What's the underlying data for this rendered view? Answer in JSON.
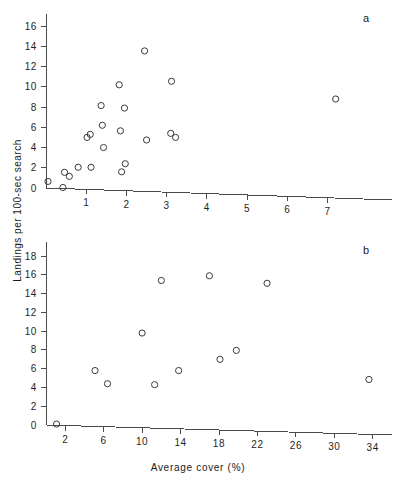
{
  "figure": {
    "y_axis_title": "Landings per 100-sec search",
    "x_axis_title": "Average cover (%)",
    "panel_a_letter": "a",
    "panel_b_letter": "b",
    "marker_color": "#3a3a3a",
    "axis_color": "#4a4a4a",
    "background_color": "#ffffff"
  },
  "chart_data": [
    {
      "type": "scatter",
      "title": "a",
      "xlabel": "Average cover (%)",
      "ylabel": "Landings per 100-sec search",
      "xlim": [
        0,
        8.6
      ],
      "ylim": [
        0,
        17.2
      ],
      "xticks": [
        1,
        2,
        3,
        4,
        5,
        6,
        7
      ],
      "xticklabels": [
        "1",
        "2",
        "3",
        "4",
        "5",
        "6",
        "7"
      ],
      "yticks": [
        2,
        4,
        6,
        8,
        10,
        12,
        14,
        16
      ],
      "yticklabels": [
        "2",
        "4",
        "6",
        "8",
        "10",
        "12",
        "14",
        "16"
      ],
      "origin_label": "0",
      "grid": false,
      "legend": false,
      "marker": "open-circle",
      "points": [
        {
          "x": 0.05,
          "y": 0.65
        },
        {
          "x": 0.42,
          "y": 0.05
        },
        {
          "x": 0.46,
          "y": 1.55
        },
        {
          "x": 0.58,
          "y": 1.15
        },
        {
          "x": 0.8,
          "y": 2.05
        },
        {
          "x": 1.02,
          "y": 5.0
        },
        {
          "x": 1.1,
          "y": 5.3
        },
        {
          "x": 1.12,
          "y": 2.05
        },
        {
          "x": 1.37,
          "y": 8.15
        },
        {
          "x": 1.4,
          "y": 6.2
        },
        {
          "x": 1.43,
          "y": 4.0
        },
        {
          "x": 1.82,
          "y": 10.2
        },
        {
          "x": 1.85,
          "y": 5.65
        },
        {
          "x": 1.88,
          "y": 1.6
        },
        {
          "x": 1.95,
          "y": 7.9
        },
        {
          "x": 1.97,
          "y": 2.4
        },
        {
          "x": 2.45,
          "y": 13.55
        },
        {
          "x": 2.5,
          "y": 4.75
        },
        {
          "x": 3.1,
          "y": 5.4
        },
        {
          "x": 3.12,
          "y": 10.55
        },
        {
          "x": 3.22,
          "y": 5.0
        },
        {
          "x": 7.2,
          "y": 8.8
        }
      ]
    },
    {
      "type": "scatter",
      "title": "b",
      "xlabel": "Average cover (%)",
      "ylabel": "Landings per 100-sec search",
      "xlim": [
        0,
        36
      ],
      "ylim": [
        0,
        19.5
      ],
      "xticks": [
        2,
        6,
        10,
        14,
        18,
        22,
        26,
        30,
        34
      ],
      "xticklabels": [
        "2",
        "6",
        "10",
        "14",
        "18",
        "22",
        "26",
        "30",
        "34"
      ],
      "yticks": [
        2,
        4,
        6,
        8,
        10,
        12,
        14,
        16,
        18
      ],
      "yticklabels": [
        "2",
        "4",
        "6",
        "8",
        "10",
        "12",
        "14",
        "16",
        "18"
      ],
      "origin_label": "0",
      "grid": false,
      "legend": false,
      "marker": "open-circle",
      "points": [
        {
          "x": 1.1,
          "y": 0.1
        },
        {
          "x": 5.1,
          "y": 5.8
        },
        {
          "x": 6.4,
          "y": 4.4
        },
        {
          "x": 10.0,
          "y": 9.8
        },
        {
          "x": 11.3,
          "y": 4.3
        },
        {
          "x": 12.0,
          "y": 15.4
        },
        {
          "x": 13.8,
          "y": 5.8
        },
        {
          "x": 17.0,
          "y": 15.9
        },
        {
          "x": 18.1,
          "y": 7.0
        },
        {
          "x": 19.8,
          "y": 7.95
        },
        {
          "x": 23.0,
          "y": 15.1
        },
        {
          "x": 33.6,
          "y": 4.85
        }
      ]
    }
  ]
}
